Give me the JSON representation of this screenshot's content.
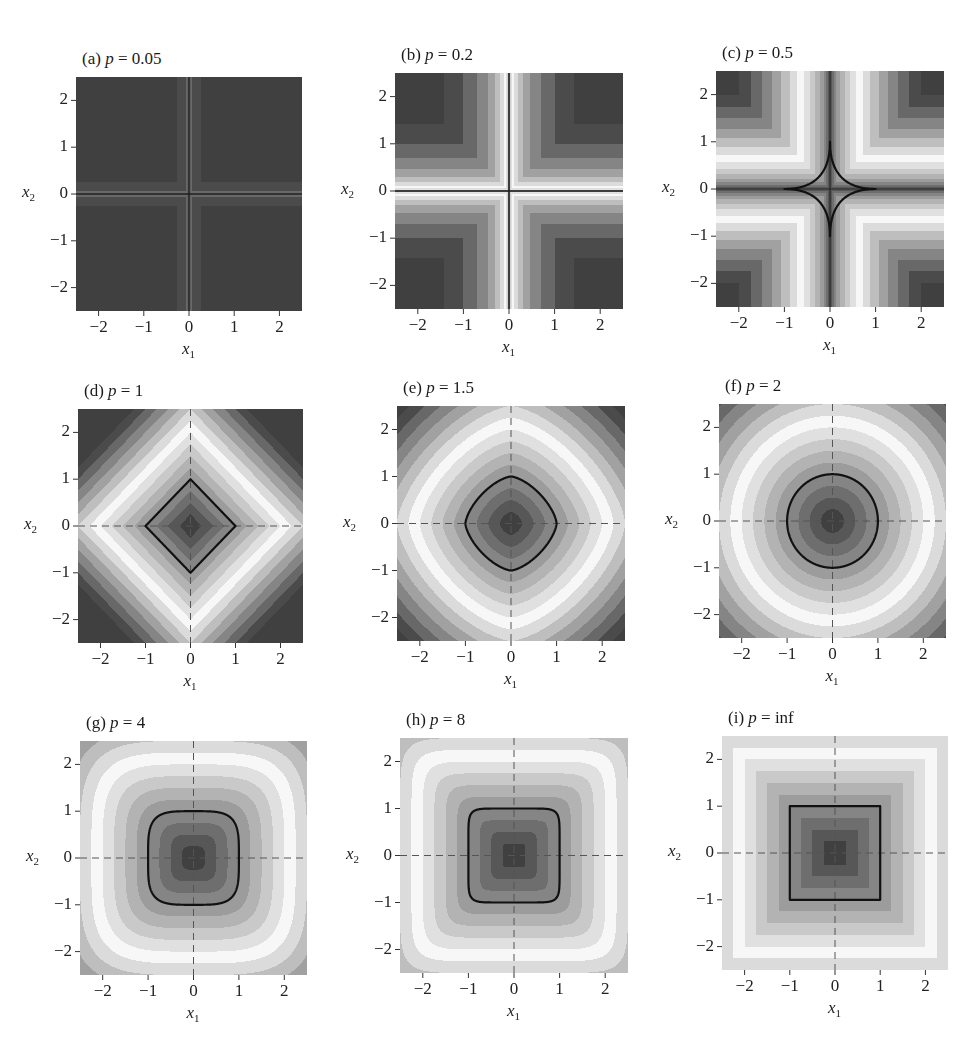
{
  "chart_data": {
    "type": "heatmap",
    "layout": "3x3 grid",
    "function": "||x||_p = (|x1|^p + |x2|^p)^(1/p)",
    "xlabel": "x1",
    "ylabel": "x2",
    "xlim": [
      -2.5,
      2.5
    ],
    "ylim": [
      -2.5,
      2.5
    ],
    "xticks": [
      -2,
      -1,
      0,
      1,
      2
    ],
    "yticks": [
      -2,
      -1,
      0,
      1,
      2
    ],
    "colormap": "banded grayscale (dark near 0 and at large values, light in between)",
    "unit_ball_contour": 1,
    "panels": [
      {
        "id": "a",
        "title": "(a) p = 0.05",
        "label": "(a)",
        "p": 0.05,
        "p_display": "0.05",
        "unit_contour": false,
        "dashed_axes": false
      },
      {
        "id": "b",
        "title": "(b) p = 0.2",
        "label": "(b)",
        "p": 0.2,
        "p_display": "0.2",
        "unit_contour": false,
        "dashed_axes": false
      },
      {
        "id": "c",
        "title": "(c) p = 0.5",
        "label": "(c)",
        "p": 0.5,
        "p_display": "0.5",
        "unit_contour": true,
        "dashed_axes": false
      },
      {
        "id": "d",
        "title": "(d) p = 1",
        "label": "(d)",
        "p": 1,
        "p_display": "1",
        "unit_contour": true,
        "dashed_axes": true
      },
      {
        "id": "e",
        "title": "(e) p = 1.5",
        "label": "(e)",
        "p": 1.5,
        "p_display": "1.5",
        "unit_contour": true,
        "dashed_axes": true
      },
      {
        "id": "f",
        "title": "(f) p = 2",
        "label": "(f)",
        "p": 2,
        "p_display": "2",
        "unit_contour": true,
        "dashed_axes": true
      },
      {
        "id": "g",
        "title": "(g) p = 4",
        "label": "(g)",
        "p": 4,
        "p_display": "4",
        "unit_contour": true,
        "dashed_axes": true
      },
      {
        "id": "h",
        "title": "(h) p = 8",
        "label": "(h)",
        "p": 8,
        "p_display": "8",
        "unit_contour": true,
        "dashed_axes": true
      },
      {
        "id": "i",
        "title": "(i) p = inf",
        "label": "(i)",
        "p": "inf",
        "p_display": "inf",
        "unit_contour": true,
        "dashed_axes": true
      }
    ]
  },
  "labels": {
    "x_axis": "x",
    "x_sub": "1",
    "y_axis": "x",
    "y_sub": "2",
    "p_symbol": "p",
    "equals": " = ",
    "ticks": [
      "−2",
      "−1",
      "0",
      "1",
      "2"
    ]
  },
  "style": {
    "contour_color": "#111111",
    "dashed_axis_color": "#555555",
    "gray_dark": "#3a3a3a",
    "gray_light": "#f4f4f4"
  }
}
